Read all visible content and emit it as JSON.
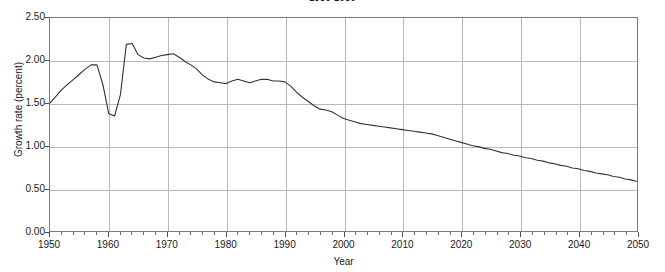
{
  "chart_data": {
    "type": "line",
    "title": "1950-2050",
    "xlabel": "Year",
    "ylabel": "Growth rate (percent)",
    "xlim": [
      1950,
      2050
    ],
    "ylim": [
      0.0,
      2.5
    ],
    "grid": true,
    "legend": false,
    "legend_position": "none",
    "line_color": "#333333",
    "grid_color": "#b9b9b9",
    "frame_color": "#7a7a7a",
    "y_ticks": [
      0.0,
      0.5,
      1.0,
      1.5,
      2.0,
      2.5
    ],
    "y_tick_labels": [
      "0.00",
      "0.50",
      "1.00",
      "1.50",
      "2.00",
      "2.50"
    ],
    "x_ticks": [
      1950,
      1960,
      1970,
      1980,
      1990,
      2000,
      2010,
      2020,
      2030,
      2040,
      2050
    ],
    "x_tick_labels": [
      "1950",
      "1960",
      "1970",
      "1980",
      "1990",
      "2000",
      "2010",
      "2020",
      "2030",
      "2040",
      "2050"
    ],
    "x_minor_tick_step": 2,
    "series": [
      {
        "name": "World population growth rate",
        "x": [
          1950,
          1951,
          1952,
          1953,
          1954,
          1955,
          1956,
          1957,
          1958,
          1959,
          1960,
          1961,
          1962,
          1963,
          1964,
          1965,
          1966,
          1967,
          1968,
          1969,
          1970,
          1971,
          1972,
          1973,
          1974,
          1975,
          1976,
          1977,
          1978,
          1979,
          1980,
          1981,
          1982,
          1983,
          1984,
          1985,
          1986,
          1987,
          1988,
          1989,
          1990,
          1991,
          1992,
          1993,
          1994,
          1995,
          1996,
          1997,
          1998,
          1999,
          2000,
          2001,
          2002,
          2003,
          2004,
          2005,
          2006,
          2007,
          2008,
          2009,
          2010,
          2011,
          2012,
          2013,
          2014,
          2015,
          2016,
          2017,
          2018,
          2019,
          2020,
          2021,
          2022,
          2023,
          2024,
          2025,
          2026,
          2027,
          2028,
          2029,
          2030,
          2031,
          2032,
          2033,
          2034,
          2035,
          2036,
          2037,
          2038,
          2039,
          2040,
          2041,
          2042,
          2043,
          2044,
          2045,
          2046,
          2047,
          2048,
          2049,
          2050
        ],
        "y": [
          1.5,
          1.58,
          1.66,
          1.72,
          1.78,
          1.84,
          1.9,
          1.95,
          1.95,
          1.72,
          1.38,
          1.35,
          1.6,
          2.19,
          2.2,
          2.07,
          2.03,
          2.02,
          2.04,
          2.06,
          2.07,
          2.08,
          2.04,
          1.99,
          1.95,
          1.9,
          1.83,
          1.78,
          1.75,
          1.74,
          1.73,
          1.76,
          1.78,
          1.76,
          1.74,
          1.76,
          1.78,
          1.78,
          1.76,
          1.76,
          1.75,
          1.7,
          1.63,
          1.57,
          1.52,
          1.47,
          1.43,
          1.42,
          1.4,
          1.36,
          1.32,
          1.3,
          1.28,
          1.26,
          1.25,
          1.24,
          1.23,
          1.22,
          1.21,
          1.2,
          1.19,
          1.18,
          1.17,
          1.16,
          1.15,
          1.14,
          1.12,
          1.1,
          1.08,
          1.06,
          1.04,
          1.02,
          1.0,
          0.99,
          0.97,
          0.96,
          0.94,
          0.92,
          0.91,
          0.89,
          0.88,
          0.86,
          0.85,
          0.83,
          0.82,
          0.8,
          0.79,
          0.77,
          0.76,
          0.74,
          0.73,
          0.71,
          0.7,
          0.68,
          0.67,
          0.66,
          0.64,
          0.63,
          0.61,
          0.6,
          0.58
        ]
      }
    ]
  }
}
